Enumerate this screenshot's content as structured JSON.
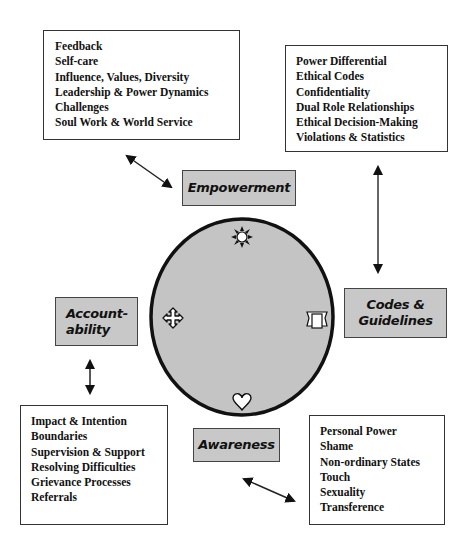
{
  "diagram": {
    "center": {
      "shape": "circle",
      "fill": "#c4c4c4",
      "icons": [
        {
          "position": "top",
          "icon": "sun-icon"
        },
        {
          "position": "left",
          "icon": "cross-arrows-icon"
        },
        {
          "position": "right",
          "icon": "scroll-icon"
        },
        {
          "position": "bottom",
          "icon": "heart-icon"
        }
      ]
    },
    "labels": {
      "empowerment": "Empowerment",
      "codes_line1": "Codes &",
      "codes_line2": "Guidelines",
      "accountability_line1": "Account-",
      "accountability_line2": "ability",
      "awareness": "Awareness"
    },
    "empowerment_topics": [
      "Feedback",
      "Self-care",
      "Influence, Values, Diversity",
      "Leadership & Power Dynamics",
      "Challenges",
      "Soul Work & World Service"
    ],
    "codes_topics": [
      "Power Differential",
      "Ethical Codes",
      "Confidentiality",
      "Dual Role Relationships",
      "Ethical Decision-Making",
      "Violations & Statistics"
    ],
    "accountability_topics": [
      "Impact & Intention",
      "Boundaries",
      "Supervision & Support",
      "Resolving Difficulties",
      "Grievance Processes",
      "Referrals"
    ],
    "awareness_topics": [
      "Personal Power",
      "Shame",
      "Non-ordinary States",
      "Touch",
      "Sexuality",
      "Transference"
    ],
    "colors": {
      "label_fill": "#c8c8c8",
      "circle_fill": "#c4c4c4",
      "stroke": "#111111"
    }
  }
}
